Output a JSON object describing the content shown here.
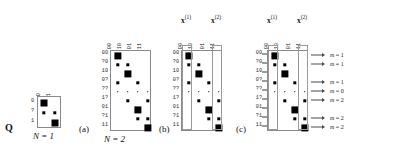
{
  "figure": {
    "caption_q": "Q",
    "panels": [
      {
        "id": "panel-n1",
        "tag": "",
        "sublabel": "N = 1",
        "row_labels": [
          "0",
          "?",
          "1"
        ],
        "col_labels": [
          "0",
          "1"
        ],
        "cells": [
          {
            "row": 0,
            "col": 0,
            "size": 7.0
          },
          {
            "row": 1,
            "col": 0,
            "size": 3.4
          },
          {
            "row": 1,
            "col": 1,
            "size": 3.4
          },
          {
            "row": 2,
            "col": 1,
            "size": 7.0
          }
        ]
      },
      {
        "id": "panel-a",
        "tag": "(a)",
        "sublabel": "N = 2",
        "row_labels": [
          "00",
          "?0",
          "10",
          "0?",
          "??",
          "1?",
          "01",
          "?1",
          "11"
        ],
        "col_labels": [
          "00",
          "10",
          "01",
          "11"
        ],
        "cells": [
          {
            "row": 0,
            "col": 0,
            "size": 7.2
          },
          {
            "row": 1,
            "col": 0,
            "size": 3.4
          },
          {
            "row": 1,
            "col": 1,
            "size": 3.4
          },
          {
            "row": 2,
            "col": 1,
            "size": 7.2
          },
          {
            "row": 3,
            "col": 0,
            "size": 3.4
          },
          {
            "row": 3,
            "col": 2,
            "size": 3.4
          },
          {
            "row": 4,
            "col": 0,
            "size": 1.6
          },
          {
            "row": 4,
            "col": 1,
            "size": 1.6
          },
          {
            "row": 4,
            "col": 2,
            "size": 1.6
          },
          {
            "row": 4,
            "col": 3,
            "size": 1.6
          },
          {
            "row": 5,
            "col": 1,
            "size": 3.4
          },
          {
            "row": 5,
            "col": 3,
            "size": 3.4
          },
          {
            "row": 6,
            "col": 2,
            "size": 7.2
          },
          {
            "row": 7,
            "col": 2,
            "size": 3.4
          },
          {
            "row": 7,
            "col": 3,
            "size": 3.4
          },
          {
            "row": 8,
            "col": 3,
            "size": 7.2
          }
        ]
      },
      {
        "id": "panel-b",
        "tag": "(b)",
        "sublabel": "",
        "row_labels": [
          "00",
          "?0",
          "10",
          "0?",
          "??",
          "1?",
          "01",
          "?1",
          "11"
        ],
        "col_labels": [
          "00",
          "10",
          "01",
          "11"
        ],
        "group_headers": [
          "x(1)",
          "x(2)"
        ],
        "highlight_cols": [
          0,
          3
        ],
        "cells": [
          {
            "row": 0,
            "col": 0,
            "size": 7.2
          },
          {
            "row": 1,
            "col": 0,
            "size": 3.4
          },
          {
            "row": 1,
            "col": 1,
            "size": 3.4
          },
          {
            "row": 2,
            "col": 1,
            "size": 7.2
          },
          {
            "row": 3,
            "col": 0,
            "size": 3.4
          },
          {
            "row": 3,
            "col": 2,
            "size": 3.4
          },
          {
            "row": 4,
            "col": 0,
            "size": 1.6
          },
          {
            "row": 4,
            "col": 1,
            "size": 1.6
          },
          {
            "row": 4,
            "col": 2,
            "size": 1.6
          },
          {
            "row": 4,
            "col": 3,
            "size": 1.6
          },
          {
            "row": 5,
            "col": 1,
            "size": 3.4
          },
          {
            "row": 5,
            "col": 3,
            "size": 3.4
          },
          {
            "row": 6,
            "col": 2,
            "size": 7.2
          },
          {
            "row": 7,
            "col": 2,
            "size": 3.4
          },
          {
            "row": 7,
            "col": 3,
            "size": 3.4
          },
          {
            "row": 8,
            "col": 3,
            "size": 7.2
          }
        ]
      },
      {
        "id": "panel-c",
        "tag": "(c)",
        "sublabel": "",
        "row_labels": [
          "00",
          "?0",
          "10",
          "0?",
          "??",
          "1?",
          "01",
          "?1",
          "11"
        ],
        "col_labels": [
          "00",
          "10",
          "01",
          "11"
        ],
        "group_headers": [
          "x(1)",
          "x(2)"
        ],
        "highlight_cols": [
          0,
          3
        ],
        "cells": [
          {
            "row": 0,
            "col": 0,
            "size": 7.2
          },
          {
            "row": 1,
            "col": 0,
            "size": 3.4
          },
          {
            "row": 1,
            "col": 1,
            "size": 3.4
          },
          {
            "row": 2,
            "col": 1,
            "size": 7.2
          },
          {
            "row": 3,
            "col": 0,
            "size": 3.4
          },
          {
            "row": 3,
            "col": 2,
            "size": 3.4
          },
          {
            "row": 4,
            "col": 0,
            "size": 1.6
          },
          {
            "row": 4,
            "col": 1,
            "size": 1.6
          },
          {
            "row": 4,
            "col": 2,
            "size": 1.6
          },
          {
            "row": 4,
            "col": 3,
            "size": 1.6
          },
          {
            "row": 5,
            "col": 1,
            "size": 3.4
          },
          {
            "row": 5,
            "col": 3,
            "size": 3.4
          },
          {
            "row": 6,
            "col": 2,
            "size": 7.2
          },
          {
            "row": 7,
            "col": 2,
            "size": 3.4
          },
          {
            "row": 7,
            "col": 3,
            "size": 3.4
          },
          {
            "row": 8,
            "col": 3,
            "size": 7.2
          }
        ],
        "annotations": [
          {
            "row": 0,
            "text": "m = 1"
          },
          {
            "row": 1,
            "text": "m = 1"
          },
          {
            "row": 3,
            "text": "m = 1"
          },
          {
            "row": 4,
            "text": "m = 0"
          },
          {
            "row": 5,
            "text": "m = 2"
          },
          {
            "row": 7,
            "text": "m = 2"
          },
          {
            "row": 8,
            "text": "m = 2"
          }
        ]
      }
    ]
  }
}
